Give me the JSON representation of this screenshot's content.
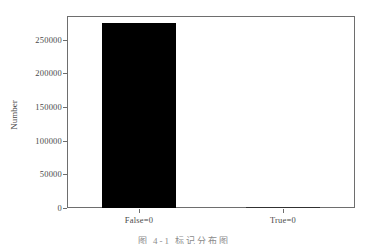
{
  "chart_data": {
    "type": "bar",
    "title": "",
    "xlabel": "",
    "ylabel": "Number",
    "categories": [
      "False=0",
      "True=0"
    ],
    "values": [
      275000,
      0
    ],
    "ylim": [
      0,
      285000
    ],
    "yticks": [
      0,
      50000,
      100000,
      150000,
      200000,
      250000
    ],
    "ytick_labels": [
      "0",
      "50000",
      "100000",
      "150000",
      "200000",
      "250000"
    ],
    "grid": false,
    "legend": null,
    "bar_color": "#000000",
    "axis_color": "#6e6e6e",
    "text_color": "#4a4a4a"
  },
  "caption": {
    "text": "图 4-1  标记分布图"
  }
}
